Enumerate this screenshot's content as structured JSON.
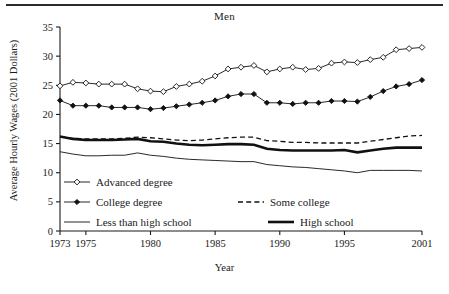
{
  "figure": {
    "title": "Men",
    "xlabel": "Year",
    "ylabel": "Average Hourly Wages (2001 Dollars)"
  },
  "legend": {
    "advanced": "Advanced degree",
    "college": "College degree",
    "some_college": "Some college",
    "less_than_hs": "Less than high school",
    "high_school": "High school"
  },
  "chart_data": {
    "type": "line",
    "title": "Men",
    "xlabel": "Year",
    "ylabel": "Average Hourly Wages (2001 Dollars)",
    "xlim": [
      1973,
      2001
    ],
    "ylim": [
      0,
      35
    ],
    "yticks": [
      0,
      5,
      10,
      15,
      20,
      25,
      30,
      35
    ],
    "xticks": [
      1973,
      1975,
      1980,
      1985,
      1990,
      1995,
      2001
    ],
    "grid": false,
    "legend_position": "lower-left",
    "x": [
      1973,
      1974,
      1975,
      1976,
      1977,
      1978,
      1979,
      1980,
      1981,
      1982,
      1983,
      1984,
      1985,
      1986,
      1987,
      1988,
      1989,
      1990,
      1991,
      1992,
      1993,
      1994,
      1995,
      1996,
      1997,
      1998,
      1999,
      2000,
      2001
    ],
    "series": [
      {
        "name": "Advanced degree",
        "marker": "open-diamond",
        "style": "solid-thin",
        "values": [
          24.9,
          25.5,
          25.4,
          25.2,
          25.2,
          25.2,
          24.4,
          24.0,
          23.9,
          24.8,
          25.2,
          25.7,
          26.6,
          27.8,
          28.1,
          28.4,
          27.3,
          27.8,
          28.1,
          27.7,
          27.9,
          28.8,
          29.0,
          28.9,
          29.4,
          29.8,
          31.1,
          31.3,
          31.5
        ]
      },
      {
        "name": "College degree",
        "marker": "filled-diamond",
        "style": "solid-thin",
        "values": [
          22.4,
          21.5,
          21.5,
          21.5,
          21.2,
          21.2,
          21.2,
          20.9,
          21.1,
          21.4,
          21.7,
          22.0,
          22.4,
          23.1,
          23.5,
          23.5,
          22.0,
          22.0,
          21.8,
          22.0,
          22.0,
          22.3,
          22.3,
          22.2,
          23.0,
          24.0,
          24.8,
          25.2,
          25.9
        ]
      },
      {
        "name": "Some college",
        "marker": "none",
        "style": "dashed",
        "values": [
          16.2,
          15.9,
          15.8,
          15.8,
          15.8,
          15.9,
          16.1,
          16.0,
          15.8,
          15.6,
          15.5,
          15.6,
          15.8,
          16.0,
          16.1,
          16.1,
          15.5,
          15.4,
          15.2,
          15.2,
          15.1,
          15.1,
          15.1,
          15.1,
          15.4,
          15.7,
          16.0,
          16.3,
          16.4
        ]
      },
      {
        "name": "High school",
        "marker": "none",
        "style": "solid-thick",
        "values": [
          16.2,
          15.8,
          15.6,
          15.6,
          15.6,
          15.7,
          15.8,
          15.4,
          15.3,
          15.0,
          14.8,
          14.7,
          14.8,
          14.9,
          14.9,
          14.8,
          14.1,
          13.9,
          13.8,
          13.8,
          13.8,
          13.8,
          13.9,
          13.5,
          13.8,
          14.1,
          14.3,
          14.3,
          14.3
        ]
      },
      {
        "name": "Less than high school",
        "marker": "none",
        "style": "solid-thin",
        "values": [
          13.6,
          13.2,
          12.9,
          12.9,
          13.0,
          13.0,
          13.4,
          13.0,
          12.8,
          12.5,
          12.3,
          12.2,
          12.1,
          12.0,
          11.9,
          11.9,
          11.4,
          11.2,
          11.0,
          10.9,
          10.7,
          10.5,
          10.3,
          10.0,
          10.4,
          10.4,
          10.4,
          10.4,
          10.3
        ]
      }
    ]
  }
}
